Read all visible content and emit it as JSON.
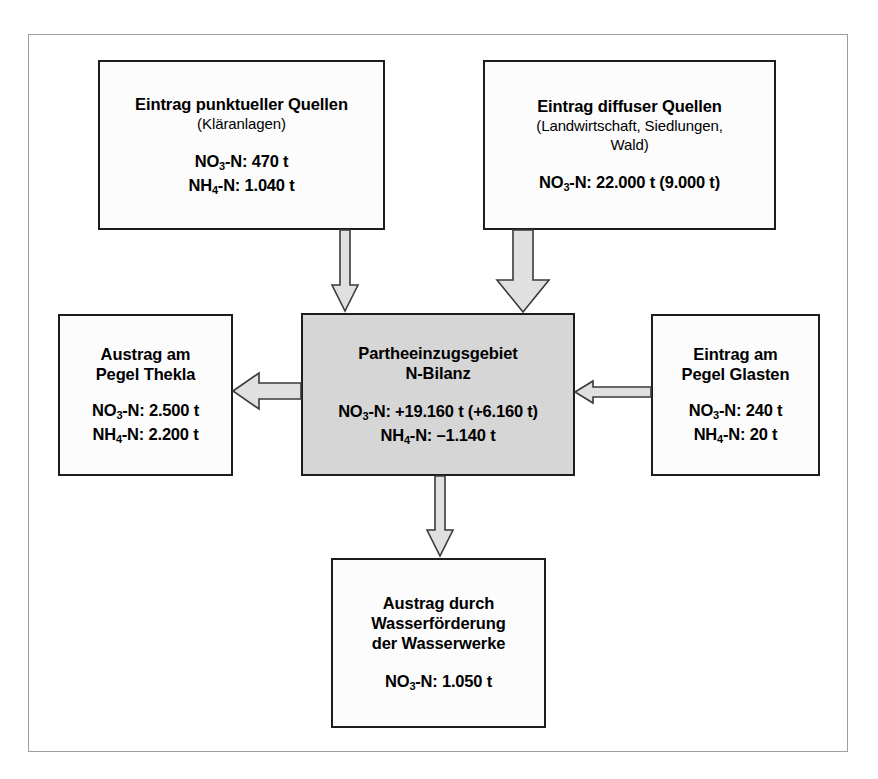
{
  "diagram": {
    "title_semantic": "Partheeinzugsgebiet Stickstoff-Bilanz Flussdiagramm",
    "nodes": {
      "point_sources": {
        "title": "Eintrag punktueller Quellen",
        "subtitle": "(Kläranlagen)",
        "values": [
          {
            "species": "NO",
            "sub": "3",
            "tail": "-N: 470 t"
          },
          {
            "species": "NH",
            "sub": "4",
            "tail": "-N: 1.040 t"
          }
        ]
      },
      "diffuse_sources": {
        "title": "Eintrag diffuser Quellen",
        "subtitle_line1": "(Landwirtschaft, Siedlungen,",
        "subtitle_line2": "Wald)",
        "values": [
          {
            "species": "NO",
            "sub": "3",
            "tail": "-N: 22.000 t (9.000 t)"
          }
        ]
      },
      "balance": {
        "title_line1": "Partheeinzugsgebiet",
        "title_line2": "N-Bilanz",
        "values": [
          {
            "species": "NO",
            "sub": "3",
            "tail": "-N: +19.160 t (+6.160 t)"
          },
          {
            "species": "NH",
            "sub": "4",
            "tail": "-N: –1.140 t"
          }
        ]
      },
      "outflow_thekla": {
        "title_line1": "Austrag am",
        "title_line2": "Pegel Thekla",
        "values": [
          {
            "species": "NO",
            "sub": "3",
            "tail": "-N: 2.500 t"
          },
          {
            "species": "NH",
            "sub": "4",
            "tail": "-N: 2.200 t"
          }
        ]
      },
      "inflow_glasten": {
        "title_line1": "Eintrag am",
        "title_line2": "Pegel Glasten",
        "values": [
          {
            "species": "NO",
            "sub": "3",
            "tail": "-N: 240 t"
          },
          {
            "species": "NH",
            "sub": "4",
            "tail": "-N: 20 t"
          }
        ]
      },
      "waterworks": {
        "title_line1": "Austrag durch",
        "title_line2": "Wasserförderung",
        "title_line3": "der Wasserwerke",
        "values": [
          {
            "species": "NO",
            "sub": "3",
            "tail": "-N: 1.050 t"
          }
        ]
      }
    },
    "arrows": [
      {
        "name": "arrow-point-sources-to-balance",
        "direction": "down"
      },
      {
        "name": "arrow-diffuse-sources-to-balance",
        "direction": "down"
      },
      {
        "name": "arrow-balance-to-thekla",
        "direction": "left"
      },
      {
        "name": "arrow-glasten-to-balance",
        "direction": "left"
      },
      {
        "name": "arrow-balance-to-waterworks",
        "direction": "down"
      }
    ],
    "colors": {
      "box_border": "#1d1d1d",
      "box_fill": "#fcfcfc",
      "center_fill": "#d6d6d6",
      "arrow_fill": "#e0e0e0",
      "arrow_stroke": "#3a3a3a",
      "frame_border": "#9d9d9d",
      "text": "#000000"
    }
  }
}
